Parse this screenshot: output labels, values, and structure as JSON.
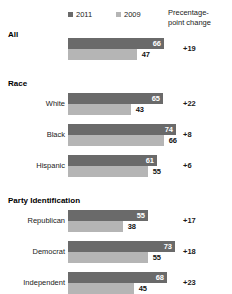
{
  "legend": {
    "entries": [
      {
        "label": "2011",
        "color": "#6a6a6a"
      },
      {
        "label": "2009",
        "color": "#b5b5b5"
      }
    ],
    "column_header_line1": "Precentage-",
    "column_header_line2": "point change"
  },
  "chart_data": {
    "type": "bar",
    "title": "",
    "xlabel": "",
    "ylabel": "",
    "orientation": "horizontal",
    "grid": false,
    "legend_position": "top",
    "xlim": [
      0,
      74
    ],
    "series": [
      {
        "name": "2011",
        "color": "#6a6a6a",
        "values": [
          66,
          65,
          74,
          61,
          55,
          73,
          68
        ]
      },
      {
        "name": "2009",
        "color": "#b5b5b5",
        "values": [
          47,
          43,
          66,
          55,
          38,
          55,
          45
        ]
      }
    ],
    "categories": [
      "All",
      "White",
      "Black",
      "Hispanic",
      "Republican",
      "Democrat",
      "Independent"
    ],
    "change_label": "Precentage-point change",
    "changes": [
      "+19",
      "+22",
      "+8",
      "+6",
      "+17",
      "+18",
      "+23"
    ],
    "groups": [
      {
        "heading": "All",
        "heading_is_row": true,
        "rows": [
          {
            "label": "All",
            "v2011": 66,
            "v2009": 47,
            "change": "+19"
          }
        ]
      },
      {
        "heading": "Race",
        "heading_is_row": false,
        "rows": [
          {
            "label": "White",
            "v2011": 65,
            "v2009": 43,
            "change": "+22"
          },
          {
            "label": "Black",
            "v2011": 74,
            "v2009": 66,
            "change": "+8"
          },
          {
            "label": "Hispanic",
            "v2011": 61,
            "v2009": 55,
            "change": "+6"
          }
        ]
      },
      {
        "heading": "Party Identification",
        "heading_is_row": false,
        "rows": [
          {
            "label": "Republican",
            "v2011": 55,
            "v2009": 38,
            "change": "+17"
          },
          {
            "label": "Democrat",
            "v2011": 73,
            "v2009": 55,
            "change": "+18"
          },
          {
            "label": "Independent",
            "v2011": 68,
            "v2009": 45,
            "change": "+23"
          }
        ]
      }
    ]
  }
}
